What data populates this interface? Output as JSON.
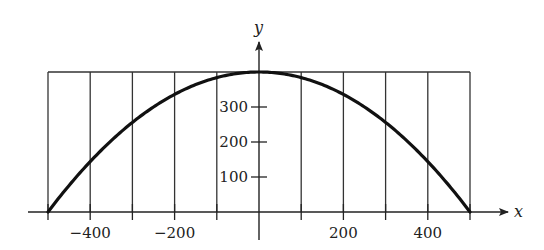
{
  "chart_data": {
    "type": "line",
    "title": "",
    "xlabel": "x",
    "ylabel": "y",
    "xlim": [
      -500,
      500
    ],
    "ylim": [
      0,
      400
    ],
    "x_ticks": [
      -500,
      -400,
      -300,
      -200,
      -100,
      0,
      100,
      200,
      300,
      400,
      500
    ],
    "x_tick_labels": [
      {
        "value": -400,
        "label": "−400"
      },
      {
        "value": -200,
        "label": "−200"
      },
      {
        "value": 200,
        "label": "200"
      },
      {
        "value": 400,
        "label": "400"
      }
    ],
    "y_ticks": [
      100,
      200,
      300
    ],
    "y_tick_labels": [
      {
        "value": 100,
        "label": "100"
      },
      {
        "value": 200,
        "label": "200"
      },
      {
        "value": 300,
        "label": "300"
      }
    ],
    "grid": false,
    "series": [
      {
        "name": "parabola",
        "equation": "y = 400 - x^2/625",
        "x": [
          -500,
          -400,
          -300,
          -200,
          -100,
          0,
          100,
          200,
          300,
          400,
          500
        ],
        "y": [
          0,
          144,
          256,
          336,
          384,
          400,
          384,
          336,
          256,
          144,
          0
        ]
      }
    ],
    "rectangle": {
      "x_from": -500,
      "x_to": 500,
      "y_top": 400,
      "vertical_lines_at": [
        -500,
        -400,
        -300,
        -200,
        -100,
        100,
        200,
        300,
        400,
        500
      ]
    }
  },
  "colors": {
    "curve": "#111111",
    "lines": "#333333",
    "background": "#ffffff"
  }
}
